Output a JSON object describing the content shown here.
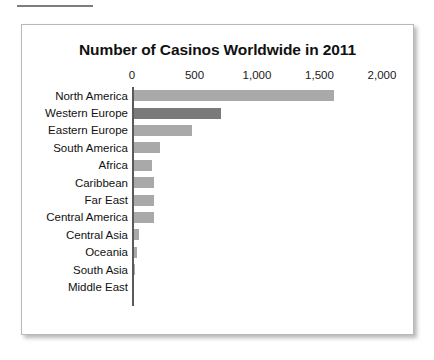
{
  "page": {
    "rule_name": "page-top-rule"
  },
  "chart_data": {
    "type": "bar",
    "orientation": "horizontal",
    "title": "Number of Casinos Worldwide in 2011",
    "xlabel": "",
    "ylabel": "",
    "xlim": [
      0,
      2000
    ],
    "grid": false,
    "legend": false,
    "tick_labels": [
      "0",
      "500",
      "1,000",
      "1,500",
      "2,000"
    ],
    "ticks": [
      0,
      500,
      1000,
      1500,
      2000
    ],
    "categories": [
      "North America",
      "Western Europe",
      "Eastern Europe",
      "South America",
      "Africa",
      "Caribbean",
      "Far East",
      "Central America",
      "Central Asia",
      "Oceania",
      "South Asia",
      "Middle East"
    ],
    "values": [
      1600,
      700,
      470,
      210,
      150,
      165,
      160,
      165,
      40,
      30,
      10,
      0
    ],
    "bar_colors": [
      "#a9a9a9",
      "#7a7a7a",
      "#a9a9a9",
      "#a9a9a9",
      "#a9a9a9",
      "#a9a9a9",
      "#a9a9a9",
      "#a9a9a9",
      "#a9a9a9",
      "#a9a9a9",
      "#a9a9a9",
      "#a9a9a9"
    ]
  },
  "colors": {
    "bar_light": "#a9a9a9",
    "bar_dark": "#7a7a7a",
    "axis": "#5a5a5a",
    "text": "#111111",
    "card_border": "#b8b8b8"
  }
}
